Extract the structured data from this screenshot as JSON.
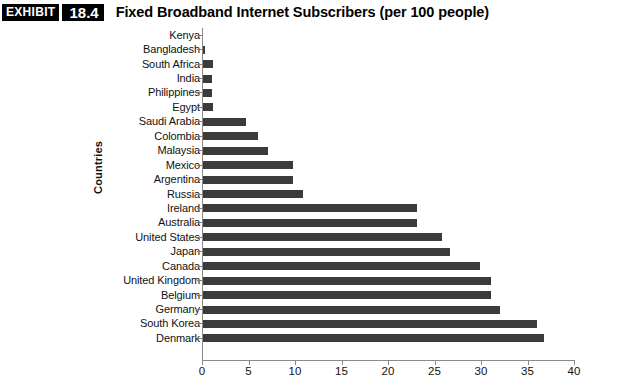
{
  "header": {
    "exhibit_word": "EXHIBIT",
    "exhibit_number": "18.4",
    "title": "Fixed Broadband Internet Subscribers (per 100 people)"
  },
  "chart_data": {
    "type": "bar",
    "orientation": "horizontal",
    "title": "Fixed Broadband Internet Subscribers (per 100 people)",
    "xlabel": "",
    "ylabel": "Countries",
    "xlim": [
      0,
      40
    ],
    "xticks": [
      0,
      5,
      10,
      15,
      20,
      25,
      30,
      35,
      40
    ],
    "xtick_labels": [
      "0",
      "5",
      "10",
      "15",
      "20",
      "25",
      "30",
      "35",
      "40"
    ],
    "grid": false,
    "legend": false,
    "bar_color": "#3b3b3b",
    "axis_color": "#8a8a8a",
    "categories": [
      "Kenya",
      "Bangladesh",
      "South Africa",
      "India",
      "Philippines",
      "Egypt",
      "Saudi Arabia",
      "Colombia",
      "Malaysia",
      "Mexico",
      "Argentina",
      "Russia",
      "Ireland",
      "Australia",
      "United States",
      "Japan",
      "Canada",
      "United Kingdom",
      "Belgium",
      "Germany",
      "South Korea",
      "Denmark"
    ],
    "values": [
      0.1,
      0.3,
      1.2,
      1.1,
      1.1,
      1.2,
      4.7,
      6.0,
      7.1,
      9.8,
      9.8,
      10.9,
      23.1,
      23.1,
      25.8,
      26.7,
      29.9,
      31.1,
      31.1,
      32.0,
      36.0,
      36.8
    ]
  }
}
